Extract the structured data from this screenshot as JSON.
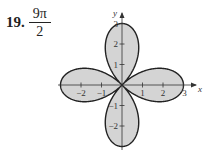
{
  "problem": {
    "number": "19.",
    "answer_numerator": "9π",
    "answer_denominator": "2"
  },
  "chart_data": {
    "type": "polar-rose",
    "equation": "r = 3cos(2θ)",
    "petals": 4,
    "petal_length": 3,
    "fill_color": "#d4d4d4",
    "stroke_color": "#222222",
    "xlabel": "x",
    "ylabel": "y",
    "xlim": [
      -3,
      3
    ],
    "ylim": [
      -3,
      3
    ],
    "x_ticks": [
      "-2",
      "-1",
      "1",
      "2",
      "3"
    ],
    "y_ticks": [
      "3",
      "2",
      "1",
      "-1",
      "-2"
    ],
    "grid": false,
    "area": "9π/2"
  }
}
